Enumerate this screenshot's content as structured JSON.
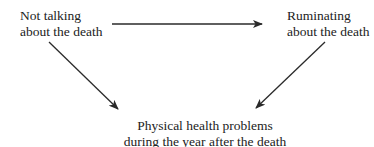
{
  "nodes": {
    "not_talking": {
      "line1": "Not talking",
      "line2": "about the death"
    },
    "ruminating": {
      "line1": "Ruminating",
      "line2": "about the death"
    },
    "physical_health": {
      "line1": "Physical health problems",
      "line2": "during the year after the death"
    }
  },
  "edges": [
    {
      "from": "Not talking about the death",
      "to": "Ruminating about the death"
    },
    {
      "from": "Not talking about the death",
      "to": "Physical health problems during the year after the death"
    },
    {
      "from": "Ruminating about the death",
      "to": "Physical health problems during the year after the death"
    }
  ],
  "colors": {
    "line": "#2a2a2a",
    "text": "#222222",
    "background": "#ffffff"
  }
}
